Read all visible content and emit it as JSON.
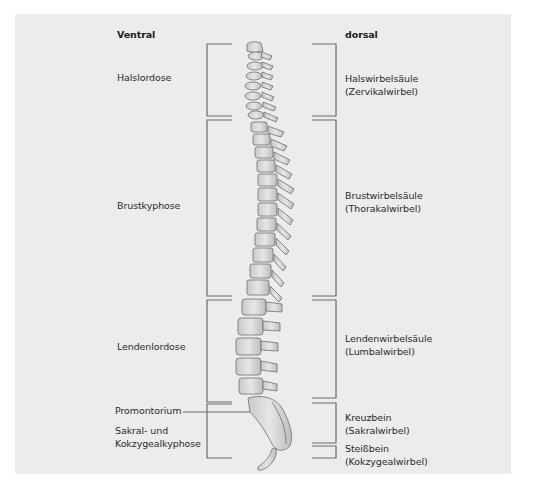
{
  "headers": {
    "left": "Ventral",
    "right": "dorsal"
  },
  "left_labels": [
    {
      "id": "halslordose",
      "text": "Halslordose"
    },
    {
      "id": "brustkyphose",
      "text": "Brustkyphose"
    },
    {
      "id": "lendenlordose",
      "text": "Lendenlordose"
    },
    {
      "id": "promontorium",
      "text": "Promontorium"
    },
    {
      "id": "sakral",
      "line1": "Sakral- und",
      "line2": "Kokzygealkyphose"
    }
  ],
  "right_labels": [
    {
      "id": "hals",
      "line1": "Halswirbelsäule",
      "line2": "(Zervikalwirbel)"
    },
    {
      "id": "brust",
      "line1": "Brustwirbelsäule",
      "line2": "(Thorakalwirbel)"
    },
    {
      "id": "lenden",
      "line1": "Lendenwirbelsäule",
      "line2": "(Lumbalwirbel)"
    },
    {
      "id": "kreuz",
      "line1": "Kreuzbein",
      "line2": "(Sakralwirbel)"
    },
    {
      "id": "steiss",
      "line1": "Steißbein",
      "line2": "(Kokzygealwirbel)"
    }
  ],
  "colors": {
    "panel": "#ececec",
    "bracket": "#6a6a6a",
    "bone_fill": "#d8d8d8",
    "bone_stroke": "#6e6e6e",
    "text": "#2b2b2b"
  }
}
